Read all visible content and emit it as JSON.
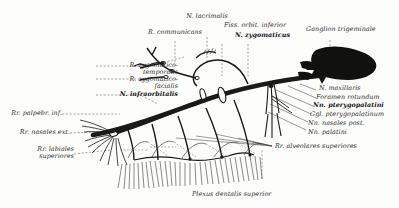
{
  "figure": {
    "caption": "Plexus dentalis superior",
    "ink_color": "#1a1a19",
    "label_color": "#2a2a28",
    "background_color": "#fdfdfc",
    "leader_color": "#555550"
  },
  "labels": {
    "r_communicans": "R. communicans",
    "n_lacrimalis": "N. lacrimalis",
    "fiss_orbit_inferior": "Fiss. orbit. inferior",
    "n_zygomaticus": "N. zygomaticus",
    "ganglion_trigeminale": "Ganglion trigeminale",
    "r_zygomatico_temporalis_1": "R. zygomatico-",
    "r_zygomatico_temporalis_2": "temporalis",
    "r_zygomatico_facialis_1": "R. zygomatico-",
    "r_zygomatico_facialis_2": "facialis",
    "n_infraorbitalis": "N. infraorbitalis",
    "rr_palpebr_inf": "Rr. palpebr. inf.",
    "rr_nasales_ext": "Rr. nasales ext.",
    "rr_labiales_superiores_1": "Rr. labiales",
    "rr_labiales_superiores_2": "superiores",
    "n_maxillaris": "N. maxillaris",
    "foramen_rotundum": "Foramen rotundum",
    "nn_pterygopalatini": "Nn. pterygopalatini",
    "ggl_pterygopalatinum": "Ggl. pterygopalatinum",
    "nn_nasales_post": "Nn. nasales post.",
    "nn_palatini": "Nn. palatini",
    "rr_alveolares_superiores": "Rr. alveolares superiores",
    "plexus_dentalis_superior": "Plexus dentalis superior"
  },
  "structures": [
    {
      "name": "ganglion-trigeminale",
      "kind": "solid-mass"
    },
    {
      "name": "nervus-maxillaris-trunk",
      "kind": "thick-nerve"
    },
    {
      "name": "nervus-infraorbitalis",
      "kind": "thick-nerve"
    },
    {
      "name": "nervus-zygomaticus",
      "kind": "nerve"
    },
    {
      "name": "ramus-communicans",
      "kind": "nerve"
    },
    {
      "name": "nervus-lacrimalis",
      "kind": "hatched-nerve"
    },
    {
      "name": "fissura-orbitalis-inferior",
      "kind": "aperture-oval"
    },
    {
      "name": "foramen-rotundum",
      "kind": "aperture-oval"
    },
    {
      "name": "ganglion-pterygopalatinum",
      "kind": "small-ganglion"
    },
    {
      "name": "nervi-pterygopalatini",
      "kind": "nerve-bundle"
    },
    {
      "name": "nervi-nasales-posteriores",
      "kind": "nerve-bundle"
    },
    {
      "name": "nervi-palatini",
      "kind": "nerve-bundle"
    },
    {
      "name": "rami-alveolares-superiores",
      "kind": "nerve-bundle"
    },
    {
      "name": "plexus-dentalis-superior",
      "kind": "plexus"
    },
    {
      "name": "maxillary-teeth-roots",
      "kind": "tooth-row"
    },
    {
      "name": "rami-palpebrales-inferiores",
      "kind": "nerve-fan"
    },
    {
      "name": "rami-nasales-externi",
      "kind": "nerve-fan"
    },
    {
      "name": "rami-labiales-superiores",
      "kind": "nerve-fan"
    }
  ]
}
